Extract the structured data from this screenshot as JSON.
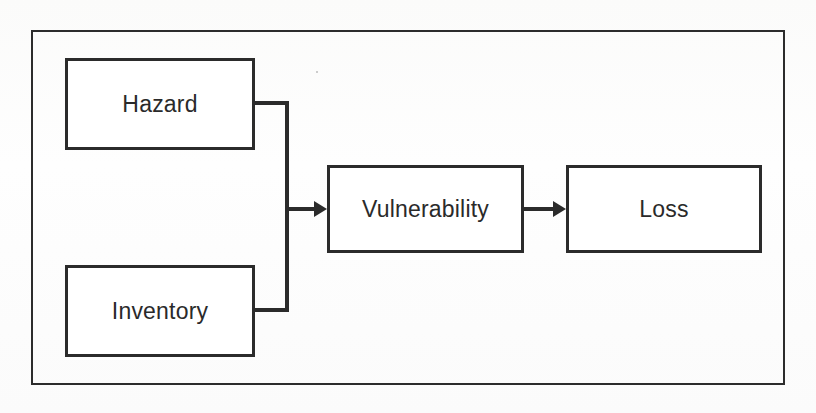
{
  "diagram": {
    "background_color": "#fdfdfd",
    "line_color": "#2b2b2b",
    "text_color": "#2a2a2a",
    "frame": {
      "label": "diagram-outer-border"
    },
    "nodes": [
      {
        "id": "hazard",
        "label": "Hazard",
        "x": 65,
        "y": 58,
        "width": 190,
        "height": 92
      },
      {
        "id": "inventory",
        "label": "Inventory",
        "x": 65,
        "y": 265,
        "width": 190,
        "height": 92
      },
      {
        "id": "vulnerability",
        "label": "Vulnerability",
        "x": 327,
        "y": 165,
        "width": 197,
        "height": 88
      },
      {
        "id": "loss",
        "label": "Loss",
        "x": 566,
        "y": 165,
        "width": 196,
        "height": 88
      }
    ],
    "edges": [
      {
        "id": "hazard-to-vulnerability",
        "from": "hazard",
        "to": "vulnerability",
        "style": "orthogonal-bracket",
        "arrow": true
      },
      {
        "id": "inventory-to-vulnerability",
        "from": "inventory",
        "to": "vulnerability",
        "style": "orthogonal-bracket",
        "arrow": true
      },
      {
        "id": "vulnerability-to-loss",
        "from": "vulnerability",
        "to": "loss",
        "style": "straight",
        "arrow": true
      }
    ]
  }
}
